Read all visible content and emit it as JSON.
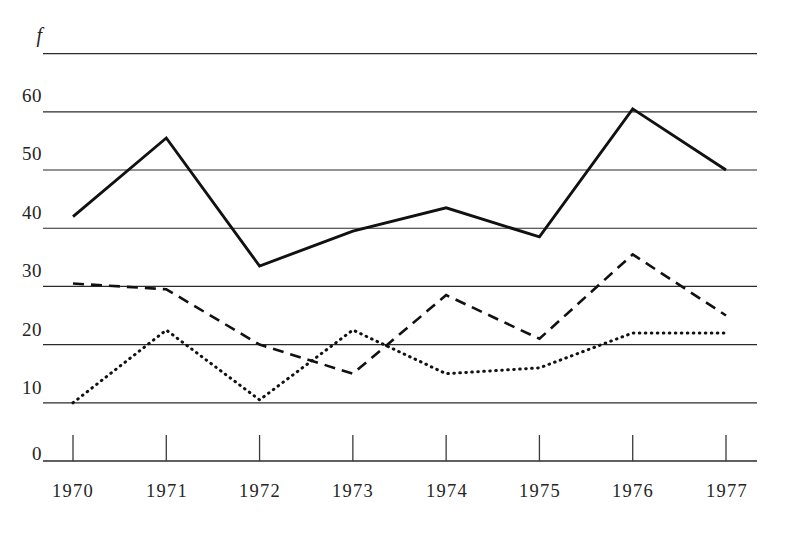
{
  "chart_data": {
    "type": "line",
    "title": "",
    "subtitle": "",
    "xlabel": "",
    "ylabel": "f",
    "ylim": [
      0,
      70
    ],
    "xlim": [
      1970,
      1977
    ],
    "grid": true,
    "legend": "none",
    "y_ticks": [
      0,
      10,
      20,
      30,
      40,
      50,
      60
    ],
    "y_tick_labels": [
      "0",
      "10",
      "20",
      "30",
      "40",
      "50",
      "60"
    ],
    "y_axis_symbol": "f",
    "categories": [
      1970,
      1971,
      1972,
      1973,
      1974,
      1975,
      1976,
      1977
    ],
    "x_tick_labels": [
      "1970",
      "1971",
      "1972",
      "1973",
      "1974",
      "1975",
      "1976",
      "1977"
    ],
    "series": [
      {
        "name": "solid-series",
        "style": "solid",
        "color": "#111111",
        "values": [
          42,
          55.5,
          33.5,
          39.5,
          43.5,
          38.5,
          60.5,
          50
        ]
      },
      {
        "name": "dashed-series",
        "style": "dashed",
        "color": "#111111",
        "values": [
          30.5,
          29.5,
          20,
          15,
          28.5,
          21,
          35.5,
          25
        ]
      },
      {
        "name": "dotted-series",
        "style": "dotted",
        "color": "#111111",
        "values": [
          10,
          22.5,
          10.5,
          22.5,
          15,
          16,
          22,
          22
        ]
      }
    ]
  },
  "axes": {
    "y_symbol": "f",
    "labels_y": [
      "60",
      "50",
      "40",
      "30",
      "20",
      "10",
      "0"
    ],
    "labels_x": [
      "1970",
      "1971",
      "1972",
      "1973",
      "1974",
      "1975",
      "1976",
      "1977"
    ]
  }
}
